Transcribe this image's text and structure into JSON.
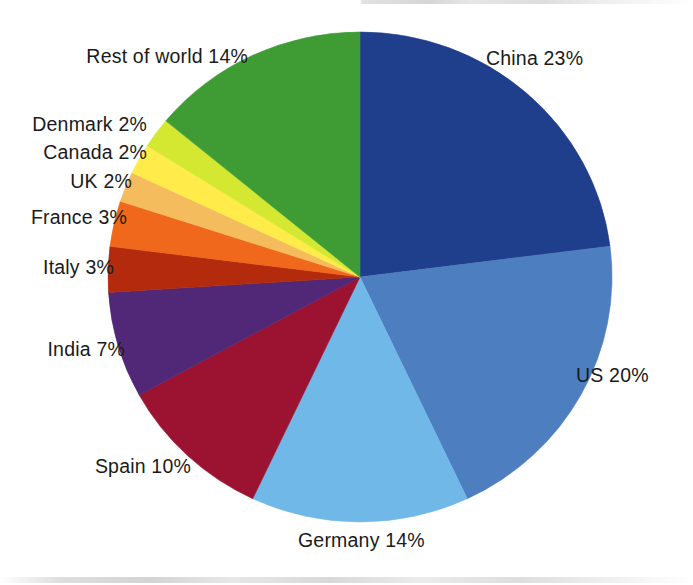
{
  "chart_data": {
    "type": "pie",
    "title": "",
    "subtitle": "",
    "xlabel": "",
    "ylabel": "",
    "legend_position": "none",
    "grid": false,
    "units": "%",
    "start_angle_deg": 0,
    "direction": "clockwise",
    "categories": [
      "China",
      "US",
      "Germany",
      "Spain",
      "India",
      "Italy",
      "France",
      "UK",
      "Canada",
      "Denmark",
      "Rest of world"
    ],
    "values": [
      23,
      20,
      14,
      10,
      7,
      3,
      3,
      2,
      2,
      2,
      14
    ],
    "colors": [
      "#1F3E8C",
      "#4D7EC0",
      "#6FB8E8",
      "#9C1231",
      "#512878",
      "#B32B0C",
      "#F0681C",
      "#F5BC5E",
      "#FFEC4A",
      "#D4E832",
      "#3F9C35"
    ],
    "slices": [
      {
        "name": "China",
        "value": 23,
        "color": "#1F3E8C",
        "label": "China 23%",
        "label_side": "right"
      },
      {
        "name": "US",
        "value": 20,
        "color": "#4D7EC0",
        "label": "US 20%",
        "label_side": "right"
      },
      {
        "name": "Germany",
        "value": 14,
        "color": "#6FB8E8",
        "label": "Germany 14%",
        "label_side": "bottom"
      },
      {
        "name": "Spain",
        "value": 10,
        "color": "#9C1231",
        "label": "Spain 10%",
        "label_side": "left"
      },
      {
        "name": "India",
        "value": 7,
        "color": "#512878",
        "label": "India 7%",
        "label_side": "left"
      },
      {
        "name": "Italy",
        "value": 3,
        "color": "#B32B0C",
        "label": "Italy 3%",
        "label_side": "left"
      },
      {
        "name": "France",
        "value": 3,
        "color": "#F0681C",
        "label": "France 3%",
        "label_side": "left"
      },
      {
        "name": "UK",
        "value": 2,
        "color": "#F5BC5E",
        "label": "UK 2%",
        "label_side": "left"
      },
      {
        "name": "Canada",
        "value": 2,
        "color": "#FFEC4A",
        "label": "Canada 2%",
        "label_side": "left"
      },
      {
        "name": "Denmark",
        "value": 2,
        "color": "#D4E832",
        "label": "Denmark 2%",
        "label_side": "left"
      },
      {
        "name": "Rest of world",
        "value": 14,
        "color": "#3F9C35",
        "label": "Rest of world 14%",
        "label_side": "top-left"
      }
    ]
  },
  "labels": {
    "china": "China 23%",
    "us": "US 20%",
    "germany": "Germany 14%",
    "spain": "Spain 10%",
    "india": "India 7%",
    "italy": "Italy 3%",
    "france": "France 3%",
    "uk": "UK 2%",
    "canada": "Canada 2%",
    "denmark": "Denmark 2%",
    "rest_of_world": "Rest of world 14%"
  }
}
